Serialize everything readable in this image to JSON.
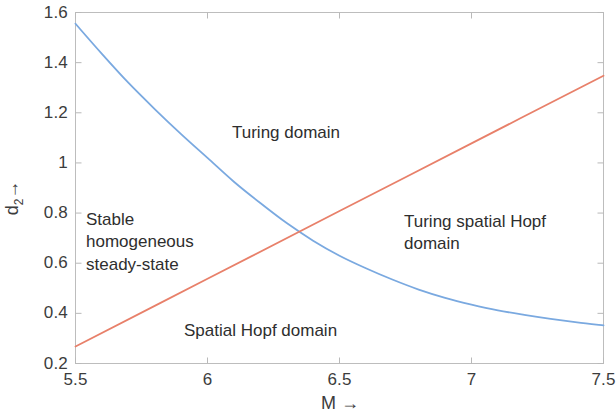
{
  "chart_data": {
    "type": "line",
    "title": "",
    "xlabel": "M →",
    "ylabel": "d₂ →",
    "xlim": [
      5.5,
      7.5
    ],
    "ylim": [
      0.2,
      1.6
    ],
    "xticks": [
      "5.5",
      "6",
      "6.5",
      "7",
      "7.5"
    ],
    "xtick_values": [
      5.5,
      6,
      6.5,
      7,
      7.5
    ],
    "yticks": [
      "0.2",
      "0.4",
      "0.6",
      "0.8",
      "1",
      "1.2",
      "1.4",
      "1.6"
    ],
    "ytick_values": [
      0.2,
      0.4,
      0.6,
      0.8,
      1.0,
      1.2,
      1.4,
      1.6
    ],
    "grid": false,
    "legend": "none",
    "series": [
      {
        "name": "Turing instability boundary",
        "color": "#7aa9e0",
        "x": [
          5.5,
          5.6,
          5.7,
          5.8,
          5.9,
          6.0,
          6.1,
          6.2,
          6.3,
          6.4,
          6.5,
          6.6,
          6.7,
          6.8,
          6.9,
          7.0,
          7.1,
          7.2,
          7.3,
          7.4,
          7.5
        ],
        "y": [
          1.555,
          1.435,
          1.32,
          1.215,
          1.115,
          1.02,
          0.925,
          0.84,
          0.76,
          0.69,
          0.63,
          0.58,
          0.535,
          0.495,
          0.462,
          0.435,
          0.412,
          0.394,
          0.378,
          0.364,
          0.352
        ]
      },
      {
        "name": "Hopf instability boundary",
        "color": "#e8806a",
        "x": [
          5.5,
          6.0,
          6.5,
          7.0,
          7.5
        ],
        "y": [
          0.268,
          0.538,
          0.808,
          1.078,
          1.348
        ]
      }
    ],
    "intersection": {
      "x": 6.23,
      "y": 0.6
    },
    "annotations": [
      {
        "id": "turing",
        "text": "Turing domain"
      },
      {
        "id": "stable",
        "text": "Stable\nhomogeneous\nsteady-state"
      },
      {
        "id": "tsh",
        "text": "Turing spatial Hopf\ndomain"
      },
      {
        "id": "hopf",
        "text": "Spatial Hopf domain"
      }
    ],
    "colors": {
      "axis": "#b9b9b9",
      "text": "#3c3c3c",
      "background": "#ffffff",
      "blue_curve": "#7aa9e0",
      "orange_curve": "#e8806a"
    }
  },
  "axes": {
    "x_title": "M →",
    "y_title_base": "d",
    "y_title_sub": "2",
    "y_title_arrow": "→"
  },
  "annotations": {
    "turing_domain": "Turing domain",
    "stable_homogeneous": "Stable\nhomogeneous\nsteady-state",
    "turing_spatial_hopf": "Turing spatial Hopf\ndomain",
    "spatial_hopf": "Spatial Hopf domain"
  }
}
